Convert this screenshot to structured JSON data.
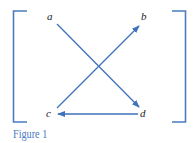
{
  "caption": "Figure 1",
  "nodes": {
    "a": {
      "label": "a",
      "x": 50,
      "y": 20
    },
    "b": {
      "label": "b",
      "x": 144,
      "y": 20
    },
    "c": {
      "label": "c",
      "x": 49,
      "y": 117
    },
    "d": {
      "label": "d",
      "x": 143,
      "y": 117
    }
  },
  "edges": [
    {
      "from": "a",
      "to": "d"
    },
    {
      "from": "c",
      "to": "b"
    },
    {
      "from": "d",
      "to": "c"
    }
  ],
  "colors": {
    "arrow": "#3d72ba",
    "bracket": "#4a7cc0",
    "caption": "#4a7cc0",
    "label": "#222222"
  }
}
